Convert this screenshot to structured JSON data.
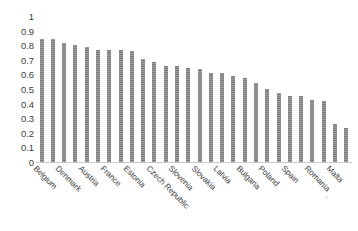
{
  "chart_data": {
    "type": "bar",
    "title": "",
    "subtitle": "",
    "xlabel": "",
    "ylabel": "",
    "ylim": [
      0,
      1
    ],
    "grid": false,
    "legend": "none",
    "bar_color": "#7f7f7f",
    "axis_text_color": "#3d3d3d",
    "x_label_rotation_deg": 45,
    "x_labels_shown_every": 2,
    "categories": [
      "Belgium",
      "Netherlands",
      "Denmark",
      "Sweden",
      "Austria",
      "Germany",
      "France",
      "Finland",
      "Estonia",
      "Ireland",
      "Czech Republic",
      "United Kingdom",
      "Slovenia",
      "Lithuania",
      "Slovakia",
      "Hungary",
      "Latvia",
      "Croatia",
      "Bulgaria",
      "Portugal",
      "Poland",
      "Italy",
      "Spain",
      "Greece",
      "Romania",
      "Cyprus",
      "Malta",
      "Luxembourg"
    ],
    "values": [
      0.845,
      0.845,
      0.82,
      0.805,
      0.79,
      0.775,
      0.775,
      0.77,
      0.765,
      0.71,
      0.69,
      0.665,
      0.66,
      0.645,
      0.64,
      0.615,
      0.615,
      0.595,
      0.58,
      0.545,
      0.505,
      0.475,
      0.455,
      0.455,
      0.425,
      0.42,
      0.26,
      0.235
    ],
    "y_ticks": [
      "1",
      "0.9",
      "0.8",
      "0.7",
      "0.6",
      "0.5",
      "0.4",
      "0.3",
      "0.2",
      "0.1",
      "0"
    ],
    "y_tick_values": [
      1,
      0.9,
      0.8,
      0.7,
      0.6,
      0.5,
      0.4,
      0.3,
      0.2,
      0.1,
      0
    ],
    "x_tick_labels": [
      "Belgium",
      "Denmark",
      "Austria",
      "France",
      "Estonia",
      "Czech Republic",
      "Slovenia",
      "Slovakia",
      "Latvia",
      "Bulgaria",
      "Poland",
      "Spain",
      "Romania",
      "Malta"
    ],
    "x_tick_label_indices": [
      0,
      2,
      4,
      6,
      8,
      10,
      12,
      14,
      16,
      18,
      20,
      22,
      24,
      26
    ]
  }
}
